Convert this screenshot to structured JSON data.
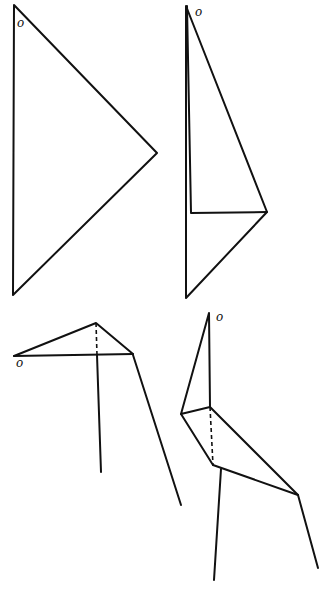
{
  "diagram": {
    "stroke_color": "#111111",
    "background": "#ffffff",
    "figures": [
      {
        "id": "step-1",
        "label": "o",
        "label_pos": [
          17,
          17
        ],
        "shape": "triangle",
        "points": [
          [
            14,
            5
          ],
          [
            157,
            153
          ],
          [
            13,
            295
          ]
        ]
      },
      {
        "id": "step-2",
        "label": "o",
        "label_pos": [
          195,
          6
        ],
        "shape": "folded triangle",
        "points": [
          [
            186,
            6
          ],
          [
            267,
            212
          ],
          [
            186,
            298
          ]
        ],
        "inner_fold": [
          [
            187,
            6
          ],
          [
            191,
            213
          ],
          [
            267,
            212
          ]
        ]
      },
      {
        "id": "step-3",
        "label": "o",
        "label_pos": [
          16,
          357
        ],
        "shape": "bird with neck horizontal",
        "lines": [
          [
            [
              14,
              356
            ],
            [
              96,
              323
            ]
          ],
          [
            [
              96,
              323
            ],
            [
              133,
              354
            ]
          ],
          [
            [
              14,
              356
            ],
            [
              133,
              354
            ]
          ],
          [
            [
              97,
              355
            ],
            [
              101,
              472
            ]
          ],
          [
            [
              133,
              355
            ],
            [
              181,
              505
            ]
          ]
        ],
        "dashed": [
          [
            [
              96,
              323
            ],
            [
              97,
              355
            ]
          ]
        ]
      },
      {
        "id": "step-4",
        "label": "o",
        "label_pos": [
          216,
          311
        ],
        "shape": "bird with neck raised",
        "lines": [
          [
            [
              209,
              313
            ],
            [
              181,
              414
            ]
          ],
          [
            [
              209,
              313
            ],
            [
              210,
              407
            ]
          ],
          [
            [
              181,
              414
            ],
            [
              210,
              407
            ]
          ],
          [
            [
              181,
              414
            ],
            [
              213,
              465
            ]
          ],
          [
            [
              210,
              407
            ],
            [
              298,
              495
            ]
          ],
          [
            [
              213,
              465
            ],
            [
              298,
              495
            ]
          ],
          [
            [
              221,
              469
            ],
            [
              214,
              580
            ]
          ],
          [
            [
              298,
              495
            ],
            [
              318,
              568
            ]
          ]
        ],
        "dashed": [
          [
            [
              210,
              407
            ],
            [
              213,
              465
            ]
          ]
        ]
      }
    ]
  }
}
